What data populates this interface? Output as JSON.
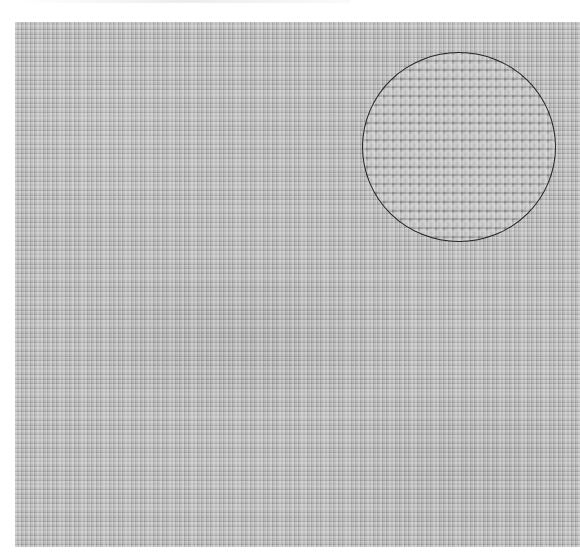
{
  "image": {
    "description": "Close-up photograph of light gray plain-weave linen fabric with a circular magnified inset in the upper right",
    "background_color": "#ffffff",
    "fabric": {
      "base_color": "#b9b9b9",
      "highlight_color": "#d0d0d0",
      "shadow_color": "#9a9a9a",
      "weave": "plain"
    },
    "magnifier_inset": {
      "outline_color": "#222222",
      "shape": "circle",
      "content": "magnified weave detail"
    }
  }
}
